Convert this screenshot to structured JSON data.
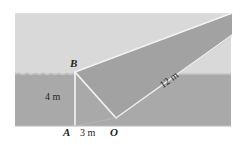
{
  "figure": {
    "points": {
      "B": "B",
      "A": "A",
      "O": "O"
    },
    "dimensions": {
      "height": "4 m",
      "base": "3 m",
      "length": "12 m"
    },
    "colors": {
      "background": "#ffffff",
      "ground_far": "#d8d8d8",
      "ground_near": "#a8a8a8",
      "prism_top": "#e2e2e2",
      "prism_side": "#9e9e9e",
      "prism_end": "#b0b0b0",
      "edge_line": "#f4f4f4",
      "text": "#231f20"
    }
  }
}
